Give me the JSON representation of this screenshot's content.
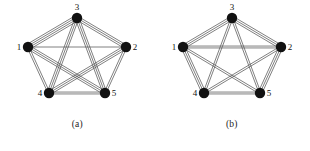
{
  "figure": {
    "type": "multigraph-pair",
    "background": "#ffffff",
    "edge_color": "#555555",
    "node_color": "#111111",
    "label_color": "#111111",
    "node_radius": 5.2,
    "vertices": [
      {
        "id": "3",
        "label": "3",
        "x": 77,
        "y": 18,
        "label_dx": 0,
        "label_dy": -8,
        "anchor": "middle"
      },
      {
        "id": "1",
        "label": "1",
        "x": 28,
        "y": 47,
        "label_dx": -9,
        "label_dy": 3,
        "anchor": "middle"
      },
      {
        "id": "2",
        "label": "2",
        "x": 126,
        "y": 47,
        "label_dx": 9,
        "label_dy": 3,
        "anchor": "middle"
      },
      {
        "id": "4",
        "label": "4",
        "x": 49,
        "y": 93,
        "label_dx": -9,
        "label_dy": 3,
        "anchor": "middle"
      },
      {
        "id": "5",
        "label": "5",
        "x": 105,
        "y": 93,
        "label_dx": 9,
        "label_dy": 3,
        "anchor": "middle"
      }
    ],
    "panels": [
      {
        "id": "panel-a",
        "caption": "(a)",
        "edges": [
          {
            "from": "1",
            "to": "3",
            "multiplicity": 4
          },
          {
            "from": "3",
            "to": "2",
            "multiplicity": 3
          },
          {
            "from": "1",
            "to": "2",
            "multiplicity": 1
          },
          {
            "from": "1",
            "to": "4",
            "multiplicity": 2
          },
          {
            "from": "2",
            "to": "5",
            "multiplicity": 2
          },
          {
            "from": "4",
            "to": "5",
            "multiplicity": 2
          },
          {
            "from": "1",
            "to": "5",
            "multiplicity": 3
          },
          {
            "from": "2",
            "to": "4",
            "multiplicity": 3
          },
          {
            "from": "3",
            "to": "4",
            "multiplicity": 3
          },
          {
            "from": "3",
            "to": "5",
            "multiplicity": 3
          }
        ]
      },
      {
        "id": "panel-b",
        "caption": "(b)",
        "edges": [
          {
            "from": "1",
            "to": "3",
            "multiplicity": 3
          },
          {
            "from": "3",
            "to": "2",
            "multiplicity": 3
          },
          {
            "from": "1",
            "to": "2",
            "multiplicity": 2
          },
          {
            "from": "1",
            "to": "4",
            "multiplicity": 3
          },
          {
            "from": "2",
            "to": "5",
            "multiplicity": 3
          },
          {
            "from": "4",
            "to": "5",
            "multiplicity": 2
          },
          {
            "from": "1",
            "to": "5",
            "multiplicity": 2
          },
          {
            "from": "2",
            "to": "4",
            "multiplicity": 2
          },
          {
            "from": "3",
            "to": "4",
            "multiplicity": 2
          },
          {
            "from": "3",
            "to": "5",
            "multiplicity": 2
          }
        ]
      }
    ]
  }
}
